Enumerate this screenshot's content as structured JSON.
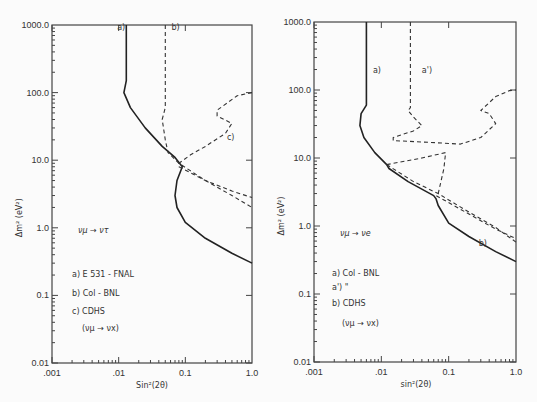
{
  "chart_data": [
    {
      "type": "line",
      "panel": "left",
      "title": "",
      "process": "ν_μ → ν_τ",
      "xlabel": "Sin²(2θ)",
      "ylabel": "Δm² (eV²)",
      "xscale": "log",
      "yscale": "log",
      "xlim": [
        0.001,
        1.0
      ],
      "ylim": [
        0.01,
        1000.0
      ],
      "xticks": [
        ".001",
        ".01",
        "0.1",
        "1.0"
      ],
      "yticks": [
        "0.01",
        "0.1",
        "1.0",
        "10.0",
        "100.0",
        "1000.0"
      ],
      "legend": [
        {
          "key": "a)",
          "text": "E 531 - FNAL"
        },
        {
          "key": "b)",
          "text": "Col - BNL"
        },
        {
          "key": "c)",
          "text": "CDHS"
        },
        {
          "key": "",
          "text": "(ν_μ → ν_x)"
        }
      ],
      "series": [
        {
          "name": "a) E 531 - FNAL",
          "style": "solid",
          "points": [
            [
              0.013,
              1000
            ],
            [
              0.013,
              150
            ],
            [
              0.012,
              100
            ],
            [
              0.015,
              60
            ],
            [
              0.025,
              30
            ],
            [
              0.045,
              16
            ],
            [
              0.07,
              11
            ],
            [
              0.09,
              8
            ],
            [
              0.075,
              5
            ],
            [
              0.07,
              3
            ],
            [
              0.075,
              2
            ],
            [
              0.1,
              1.2
            ],
            [
              0.2,
              0.7
            ],
            [
              0.5,
              0.42
            ],
            [
              1.0,
              0.3
            ]
          ]
        },
        {
          "name": "b) Col - BNL",
          "style": "dashed",
          "points": [
            [
              0.05,
              1000
            ],
            [
              0.05,
              60
            ],
            [
              0.045,
              40
            ],
            [
              0.05,
              20
            ],
            [
              0.055,
              13
            ],
            [
              0.08,
              9
            ],
            [
              0.2,
              5
            ],
            [
              0.5,
              3
            ],
            [
              1.0,
              2.0
            ]
          ]
        },
        {
          "name": "c) CDHS",
          "style": "dashed",
          "points": [
            [
              1.0,
              100
            ],
            [
              0.6,
              90
            ],
            [
              0.3,
              55
            ],
            [
              0.3,
              45
            ],
            [
              0.5,
              35
            ],
            [
              0.4,
              25
            ],
            [
              0.2,
              16
            ],
            [
              0.12,
              12
            ],
            [
              0.08,
              9
            ],
            [
              0.08,
              8
            ],
            [
              0.2,
              5
            ],
            [
              0.5,
              3.5
            ],
            [
              1.0,
              2.8
            ]
          ]
        }
      ],
      "annotations": [
        "a)",
        "b)",
        "c)"
      ]
    },
    {
      "type": "line",
      "panel": "right",
      "title": "",
      "process": "ν_μ → ν_e",
      "xlabel": "sin²(2θ)",
      "ylabel": "Δm² (eV²)",
      "xscale": "log",
      "yscale": "log",
      "xlim": [
        0.001,
        1.0
      ],
      "ylim": [
        0.01,
        1000.0
      ],
      "xticks": [
        ".001",
        ".01",
        "0.1",
        "1.0"
      ],
      "yticks": [
        "0.01",
        "0.1",
        "1.0",
        "10.0",
        "100.0",
        "1000.0"
      ],
      "legend": [
        {
          "key": "a)",
          "text": "Col - BNL"
        },
        {
          "key": "a')",
          "text": "\""
        },
        {
          "key": "b)",
          "text": "CDHS"
        },
        {
          "key": "",
          "text": "(ν_μ → ν_x)"
        }
      ],
      "series": [
        {
          "name": "a) Col - BNL",
          "style": "solid",
          "points": [
            [
              0.006,
              1000
            ],
            [
              0.006,
              60
            ],
            [
              0.005,
              45
            ],
            [
              0.0048,
              30
            ],
            [
              0.0055,
              20
            ],
            [
              0.008,
              12
            ],
            [
              0.012,
              8
            ],
            [
              0.013,
              7
            ],
            [
              0.025,
              4.5
            ],
            [
              0.06,
              2.8
            ],
            [
              0.065,
              2.5
            ],
            [
              0.07,
              2
            ],
            [
              0.1,
              1.1
            ],
            [
              0.2,
              0.7
            ],
            [
              0.5,
              0.42
            ],
            [
              1.0,
              0.3
            ]
          ]
        },
        {
          "name": "a') Col - BNL",
          "style": "dashed",
          "points": [
            [
              0.027,
              1000
            ],
            [
              0.027,
              55
            ],
            [
              0.025,
              50
            ],
            [
              0.03,
              40
            ],
            [
              0.04,
              30
            ],
            [
              0.03,
              25
            ],
            [
              0.015,
              20
            ],
            [
              0.015,
              18
            ],
            [
              0.05,
              17
            ],
            [
              0.15,
              16
            ],
            [
              0.3,
              20
            ],
            [
              0.5,
              32
            ],
            [
              0.4,
              45
            ],
            [
              0.3,
              50
            ],
            [
              0.5,
              80
            ],
            [
              0.8,
              98
            ],
            [
              1.0,
              100
            ]
          ]
        },
        {
          "name": "a') inner",
          "style": "dashed",
          "points": [
            [
              0.012,
              8
            ],
            [
              0.04,
              10
            ],
            [
              0.09,
              12
            ],
            [
              0.085,
              7
            ],
            [
              0.07,
              3
            ],
            [
              0.065,
              2.8
            ],
            [
              0.2,
              1.5
            ],
            [
              0.5,
              0.9
            ],
            [
              1.0,
              0.65
            ]
          ]
        },
        {
          "name": "b) CDHS",
          "style": "dashed",
          "points": [
            [
              0.012,
              8
            ],
            [
              0.03,
              4.5
            ],
            [
              0.07,
              3
            ],
            [
              0.2,
              1.6
            ],
            [
              0.5,
              0.95
            ],
            [
              1.0,
              0.58
            ]
          ]
        }
      ],
      "annotations": [
        "a)",
        "a')",
        "b)"
      ]
    }
  ]
}
